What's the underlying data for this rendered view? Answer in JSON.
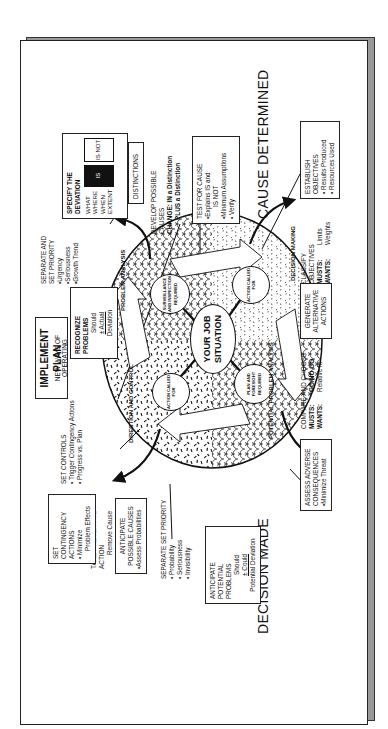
{
  "header": {
    "title": "IMPLEMENT PLAN",
    "subtitle": "NEW WAYS OF OPERATING"
  },
  "outcomes": {
    "cause": "CAUSE DETERMINED",
    "decision": "DECISION MADE"
  },
  "center": {
    "label": "YOUR JOB SITUATION"
  },
  "nodes": {
    "surveillance": "SURVEILLANCE AND INSPECTION REQUIRED",
    "action_pa": "ACTION CALLED FOR",
    "plan_foresight": "PLAN AND FORESIGHT REQUIRED",
    "action_dc": "ACTION CALLED FOR"
  },
  "regions": {
    "problem_analysis": "PROBLEM ANALYSIS",
    "decision_making": "DECISION MAKING",
    "potential_problem": "POTENTIAL PROBLEM ANALYSIS",
    "direction_control": "DIRECTION AND CONTROL"
  },
  "problem_analysis": {
    "recognize": {
      "title": "RECOGNIZE PROBLEMS",
      "lines": [
        "Should",
        "± Actual",
        "Deviation"
      ]
    },
    "separate": {
      "title": "SEPARATE AND SET PRIORITY",
      "items": [
        "•Urgency",
        "•Seriousness",
        "•Growth Trend"
      ]
    },
    "specify": {
      "title": "SPECIFY THE DEVIATION",
      "rows": [
        "WHAT",
        "WHERE",
        "WHEN",
        "EXTENT"
      ],
      "is": "IS",
      "is_not": "IS NOT"
    },
    "distinctions": "DISTINCTIONS",
    "develop": {
      "title": "DEVELOP POSSIBLE CAUSES",
      "lines": [
        "CHANGE: IN a Distinction",
        "PLUS a Distinction"
      ]
    },
    "test": {
      "title": "TEST FOR CAUSE",
      "items": [
        "•Explains IS and",
        "IS NOT",
        "•Minimum Assumptions",
        "• Verify"
      ]
    }
  },
  "decision_making": {
    "establish": {
      "title": "ESTABLISH OBJECTIVES",
      "items": [
        "• Results Produced",
        "• Resources Used"
      ]
    },
    "classify": {
      "title": "CLASSIFY OBJECTIVES",
      "rows": [
        [
          "MUSTS:",
          "Limits"
        ],
        [
          "WANTS:",
          "Weights"
        ]
      ]
    },
    "generate": {
      "title": "GENERATE ALTERNATIVE ACTIONS"
    },
    "compare": {
      "title": "COMPARE AND CHOOSE",
      "rows": [
        [
          "MUSTS:",
          "GO/NO GO"
        ],
        [
          "WANTS:",
          "Relative fit"
        ]
      ]
    },
    "adverse": {
      "title": "ASSESS ADVERSE CONSEQUENCES",
      "items": [
        "•Minimize Threat"
      ]
    }
  },
  "potential_problem": {
    "anticipate_problems": {
      "title": "ANTICIPATE POTENTIAL PROBLEMS",
      "lines": [
        "Should",
        "± Could",
        "Potential Deviation"
      ]
    },
    "separate": {
      "title": "SEPARATE SET PRIORITY",
      "items": [
        "• Probability",
        "• Seriousness",
        "• Invisibility"
      ]
    },
    "anticipate_causes": {
      "title": "ANTICIPATE POSSIBLE CAUSES",
      "items": [
        "•Assess Probabilities"
      ]
    },
    "preventive": {
      "title": "TAKE PREVENTIVE ACTION",
      "lines": [
        "Remove Cause"
      ]
    },
    "contingency": {
      "title": "SET CONTINGENCY ACTIONS",
      "items": [
        "• Minimize",
        "Problem Effects"
      ]
    },
    "controls": {
      "title": "SET CONTROLS",
      "items": [
        "• Trigger Contingency Actions",
        "• Progress vs. Plan"
      ]
    }
  },
  "colors": {
    "ink": "#111111",
    "shadow": "#999999",
    "paper": "#ffffff"
  }
}
